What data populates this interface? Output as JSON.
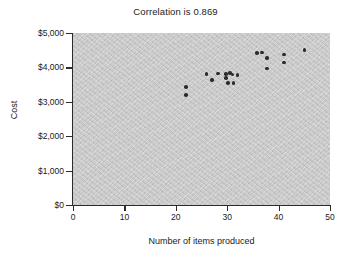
{
  "chart_data": {
    "type": "scatter",
    "title": "Correlation is 0.869",
    "xlabel": "Number of items produced",
    "ylabel": "Cost",
    "xlim": [
      0,
      50
    ],
    "ylim": [
      0,
      5000
    ],
    "grid": false,
    "legend": null,
    "correlation": 0.869,
    "xticks": [
      0,
      10,
      20,
      30,
      40,
      50
    ],
    "xtick_labels": [
      "0",
      "10",
      "20",
      "30",
      "40",
      "50"
    ],
    "yticks": [
      0,
      1000,
      2000,
      3000,
      4000,
      5000
    ],
    "ytick_labels": [
      "$0",
      "$1,000",
      "$2,000",
      "$3,000",
      "$4,000",
      "$5,000"
    ],
    "marker_color": "#2b2b2b",
    "plot_background_color": "#c9c9c9",
    "points": [
      {
        "x": 22.0,
        "y": 3430
      },
      {
        "x": 22.0,
        "y": 3190
      },
      {
        "x": 26.0,
        "y": 3810
      },
      {
        "x": 27.0,
        "y": 3640
      },
      {
        "x": 28.2,
        "y": 3820
      },
      {
        "x": 29.8,
        "y": 3800
      },
      {
        "x": 29.8,
        "y": 3700
      },
      {
        "x": 30.6,
        "y": 3840
      },
      {
        "x": 31.0,
        "y": 3790
      },
      {
        "x": 30.2,
        "y": 3540
      },
      {
        "x": 31.2,
        "y": 3540
      },
      {
        "x": 32.0,
        "y": 3780
      },
      {
        "x": 35.8,
        "y": 4420
      },
      {
        "x": 36.8,
        "y": 4430
      },
      {
        "x": 37.8,
        "y": 4270
      },
      {
        "x": 37.8,
        "y": 3970
      },
      {
        "x": 41.0,
        "y": 4380
      },
      {
        "x": 41.0,
        "y": 4140
      },
      {
        "x": 45.0,
        "y": 4510
      }
    ]
  }
}
